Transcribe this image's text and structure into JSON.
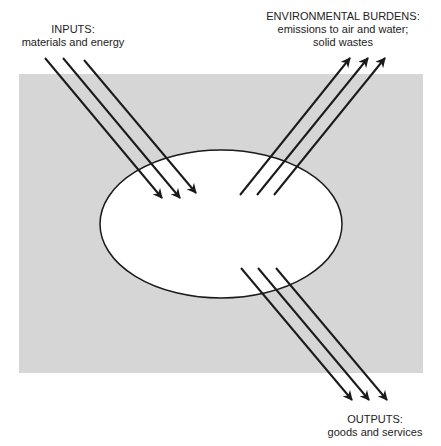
{
  "colors": {
    "background": "#ffffff",
    "system_boundary_fill": "#d6d6d6",
    "process_fill": "#ffffff",
    "stroke": "#1a1a1a",
    "text": "#222222"
  },
  "labels": {
    "inputs": {
      "title": "INPUTS:",
      "lines": [
        "materials and energy"
      ]
    },
    "burdens": {
      "title": "ENVIRONMENTAL BURDENS:",
      "lines": [
        "emissions to air and water;",
        "solid wastes"
      ]
    },
    "outputs": {
      "title": "OUTPUTS:",
      "lines": [
        "goods and services"
      ]
    }
  },
  "shapes": {
    "system_boundary": {
      "x": 19,
      "y": 74,
      "width": 404,
      "height": 299
    },
    "process": {
      "cx": 221,
      "cy": 224,
      "rx": 121,
      "ry": 74
    }
  },
  "arrows": {
    "inputs": [
      {
        "x1": 45,
        "y1": 58,
        "x2": 162,
        "y2": 198
      },
      {
        "x1": 63,
        "y1": 58,
        "x2": 180,
        "y2": 198
      },
      {
        "x1": 84,
        "y1": 60,
        "x2": 196,
        "y2": 193
      }
    ],
    "burdens": [
      {
        "x1": 240,
        "y1": 195,
        "x2": 350,
        "y2": 58
      },
      {
        "x1": 257,
        "y1": 195,
        "x2": 368,
        "y2": 58
      },
      {
        "x1": 274,
        "y1": 195,
        "x2": 385,
        "y2": 58
      }
    ],
    "outputs": [
      {
        "x1": 241,
        "y1": 268,
        "x2": 352,
        "y2": 400
      },
      {
        "x1": 258,
        "y1": 268,
        "x2": 369,
        "y2": 400
      },
      {
        "x1": 276,
        "y1": 268,
        "x2": 387,
        "y2": 400
      }
    ]
  }
}
